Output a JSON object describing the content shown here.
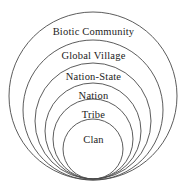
{
  "diagram": {
    "background_color": "#ffffff",
    "stroke_color": "#4a4a4a",
    "text_color": "#222222",
    "rings": [
      {
        "label": "Biotic Community",
        "level": 1,
        "cx": 93,
        "cy": 96,
        "r": 84,
        "label_y": 27,
        "font_size": 10.5
      },
      {
        "label": "Global Village",
        "level": 2,
        "cx": 93,
        "cy": 110,
        "r": 70,
        "label_y": 51,
        "font_size": 10.5
      },
      {
        "label": "Nation-State",
        "level": 3,
        "cx": 93,
        "cy": 121,
        "r": 58,
        "label_y": 72,
        "font_size": 10.5
      },
      {
        "label": "Nation",
        "level": 4,
        "cx": 93,
        "cy": 131,
        "r": 48,
        "label_y": 91,
        "font_size": 10.5
      },
      {
        "label": "Tribe",
        "level": 5,
        "cx": 93,
        "cy": 139,
        "r": 40,
        "label_y": 110,
        "font_size": 10.5
      },
      {
        "label": "Clan",
        "level": 6,
        "cx": 93,
        "cy": 149,
        "r": 30,
        "label_y": 135,
        "font_size": 10.5
      }
    ]
  }
}
